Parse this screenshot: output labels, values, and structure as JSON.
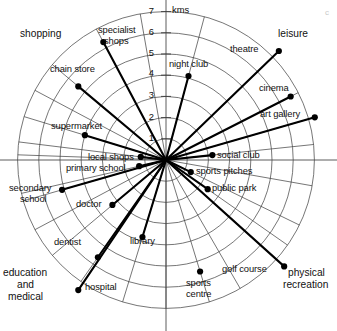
{
  "chart_data": {
    "type": "scatter",
    "subtype": "polar-radial-distance",
    "title": "",
    "unit_label": "kms",
    "rlim": [
      0,
      7
    ],
    "r_ticks": [
      1,
      2,
      3,
      4,
      5,
      6,
      7
    ],
    "r_tick_labels": [
      "1",
      "2",
      "3",
      "4",
      "5",
      "6",
      "7"
    ],
    "grid": true,
    "rings": 7,
    "spokes": 19,
    "legend": "none",
    "angle_convention": "degrees counter-clockwise from east",
    "categories": [
      {
        "name": "shopping",
        "label": "shopping"
      },
      {
        "name": "leisure",
        "label": "leisure"
      },
      {
        "name": "physical-recreation",
        "label": "physical\nrecreation"
      },
      {
        "name": "education-and-medical",
        "label": "education\nand\nmedical"
      }
    ],
    "points": [
      {
        "label": "specialist shops",
        "r": 6.3,
        "angle": 118,
        "category": "shopping",
        "has_line": true
      },
      {
        "label": "chain store",
        "r": 5.4,
        "angle": 140,
        "category": "shopping",
        "has_line": true
      },
      {
        "label": "supermarket",
        "r": 4.0,
        "angle": 163,
        "category": "shopping",
        "has_line": true
      },
      {
        "label": "local shops",
        "r": 1.2,
        "angle": 173,
        "category": "shopping",
        "has_line": true
      },
      {
        "label": "primary school",
        "r": 1.3,
        "angle": 193,
        "category": "education-and-medical",
        "has_line": true
      },
      {
        "label": "secondary school",
        "r": 5.1,
        "angle": 196,
        "category": "education-and-medical",
        "has_line": true
      },
      {
        "label": "doctor",
        "r": 3.3,
        "angle": 220,
        "category": "education-and-medical",
        "has_line": true
      },
      {
        "label": "dentist",
        "r": 5.6,
        "angle": 235,
        "category": "education-and-medical",
        "has_line": true
      },
      {
        "label": "hospital",
        "r": 7.4,
        "angle": 236,
        "category": "education-and-medical",
        "has_line": true
      },
      {
        "label": "library",
        "r": 3.8,
        "angle": 253,
        "category": "education-and-medical",
        "has_line": true
      },
      {
        "label": "sports centre",
        "r": 5.5,
        "angle": 287,
        "category": "physical-recreation",
        "has_line": false
      },
      {
        "label": "golf course",
        "r": 7.5,
        "angle": 318,
        "category": "physical-recreation",
        "has_line": true
      },
      {
        "label": "public park",
        "r": 2.4,
        "angle": 325,
        "category": "physical-recreation",
        "has_line": true
      },
      {
        "label": "sports pitches",
        "r": 1.3,
        "angle": 334,
        "category": "physical-recreation",
        "has_line": true
      },
      {
        "label": "social club",
        "r": 2.2,
        "angle": 6,
        "category": "leisure",
        "has_line": true
      },
      {
        "label": "art gallery",
        "r": 7.3,
        "angle": 16,
        "category": "leisure",
        "has_line": true
      },
      {
        "label": "cinema",
        "r": 6.6,
        "angle": 27,
        "category": "leisure",
        "has_line": true
      },
      {
        "label": "theatre",
        "r": 7.4,
        "angle": 44,
        "category": "leisure",
        "has_line": true
      },
      {
        "label": "night club",
        "r": 4.1,
        "angle": 75,
        "category": "leisure",
        "has_line": true
      }
    ]
  },
  "labels": {
    "unit": "kms",
    "tick_1": "1",
    "tick_2": "2",
    "tick_3": "3",
    "tick_4": "4",
    "tick_5": "5",
    "tick_6": "6",
    "tick_7": "7",
    "specialist_shops": "specialist shops",
    "specialist_shops_l1": "specialist",
    "specialist_shops_l2": "shops",
    "chain_store": "chain store",
    "supermarket": "supermarket",
    "local_shops": "local shops",
    "primary_school": "primary school",
    "secondary_school_l1": "secondary",
    "secondary_school_l2": "school",
    "doctor": "doctor",
    "dentist": "dentist",
    "hospital": "hospital",
    "library": "library",
    "sports_centre_l1": "sports",
    "sports_centre_l2": "centre",
    "golf_course": "golf course",
    "public_park": "public park",
    "sports_pitches": "sports pitches",
    "social_club": "social club",
    "art_gallery": "art gallery",
    "cinema": "cinema",
    "theatre": "theatre",
    "night_club": "night club"
  },
  "categories": {
    "shopping": "shopping",
    "leisure": "leisure",
    "physical_recreation_l1": "physical",
    "physical_recreation_l2": "recreation",
    "education_l1": "education",
    "education_l2": "and",
    "education_l3": "medical"
  },
  "misc": {
    "corner_mark": "c"
  },
  "colors": {
    "background": "#ffffff",
    "grid": "#3b3b3b",
    "ray": "#000000",
    "dot": "#000000",
    "text": "#111111",
    "corner_mark": "#c9c9c9"
  }
}
